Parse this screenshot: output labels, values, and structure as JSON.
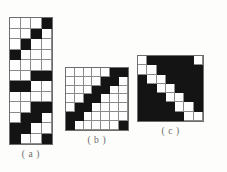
{
  "document": {
    "kind": "figure-plate",
    "background_color": "#fdfdfc",
    "cell_on_color": "#141414",
    "cell_off_color": "#fefefe",
    "grid_line_color": "#8a8a8a"
  },
  "figures": [
    {
      "id": "a",
      "caption": "( a )",
      "columns": 4,
      "rows": 12,
      "cell_px": 10.5,
      "matrix": [
        [
          0,
          0,
          0,
          1
        ],
        [
          0,
          0,
          1,
          0
        ],
        [
          0,
          1,
          0,
          0
        ],
        [
          1,
          0,
          0,
          0
        ],
        [
          0,
          0,
          0,
          0
        ],
        [
          0,
          0,
          1,
          1
        ],
        [
          1,
          1,
          0,
          0
        ],
        [
          0,
          0,
          0,
          0
        ],
        [
          0,
          0,
          1,
          1
        ],
        [
          0,
          1,
          1,
          0
        ],
        [
          1,
          1,
          0,
          0
        ],
        [
          1,
          0,
          0,
          1
        ]
      ]
    },
    {
      "id": "b",
      "caption": "( b )",
      "columns": 7,
      "rows": 7,
      "cell_px": 8.8,
      "matrix": [
        [
          0,
          0,
          0,
          0,
          0,
          1,
          1
        ],
        [
          0,
          0,
          0,
          0,
          1,
          1,
          0
        ],
        [
          0,
          0,
          0,
          1,
          1,
          0,
          0
        ],
        [
          0,
          0,
          1,
          1,
          0,
          0,
          0
        ],
        [
          0,
          1,
          1,
          0,
          0,
          0,
          0
        ],
        [
          1,
          1,
          0,
          0,
          0,
          0,
          0
        ],
        [
          1,
          0,
          0,
          0,
          0,
          0,
          1
        ]
      ]
    },
    {
      "id": "c",
      "caption": "( c )",
      "columns": 7,
      "rows": 7,
      "cell_px": 9.3,
      "matrix": [
        [
          0,
          1,
          1,
          1,
          1,
          1,
          0
        ],
        [
          0,
          0,
          1,
          1,
          1,
          1,
          1
        ],
        [
          1,
          0,
          0,
          1,
          1,
          1,
          1
        ],
        [
          1,
          1,
          0,
          0,
          1,
          1,
          1
        ],
        [
          1,
          1,
          1,
          0,
          0,
          1,
          1
        ],
        [
          1,
          1,
          1,
          1,
          0,
          0,
          1
        ],
        [
          1,
          1,
          1,
          1,
          1,
          0,
          0
        ]
      ]
    }
  ]
}
